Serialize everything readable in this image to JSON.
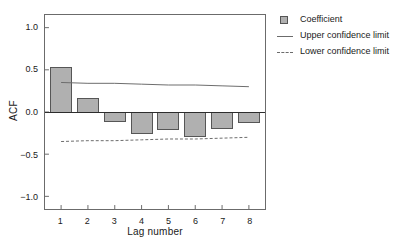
{
  "chart_data": {
    "type": "bar",
    "title": "",
    "subtitle": "",
    "xlabel": "Lag number",
    "ylabel": "ACF",
    "categories": [
      "1",
      "2",
      "3",
      "4",
      "5",
      "6",
      "7",
      "8"
    ],
    "x": [
      1,
      2,
      3,
      4,
      5,
      6,
      7,
      8
    ],
    "values": [
      0.53,
      0.16,
      -0.11,
      -0.25,
      -0.21,
      -0.29,
      -0.19,
      -0.13
    ],
    "series": [
      {
        "name": "Coefficient",
        "type": "bar",
        "values": [
          0.53,
          0.16,
          -0.11,
          -0.25,
          -0.21,
          -0.29,
          -0.19,
          -0.13
        ]
      },
      {
        "name": "Upper confidence limit",
        "type": "line",
        "style": "solid",
        "values": [
          0.35,
          0.34,
          0.34,
          0.33,
          0.32,
          0.32,
          0.31,
          0.3
        ]
      },
      {
        "name": "Lower confidence limit",
        "type": "line",
        "style": "dashed",
        "values": [
          -0.35,
          -0.34,
          -0.34,
          -0.33,
          -0.32,
          -0.32,
          -0.31,
          -0.3
        ]
      }
    ],
    "ylim": [
      -1.15,
      1.15
    ],
    "xlim": [
      0.4,
      8.6
    ],
    "yticks": [
      1.0,
      0.5,
      0.0,
      -0.5,
      -1.0
    ],
    "ytick_labels": [
      "1.0",
      "0.5",
      "0.0",
      "-0.5",
      "-1.0"
    ],
    "xticks": [
      1,
      2,
      3,
      4,
      5,
      6,
      7,
      8
    ],
    "xtick_labels": [
      "1",
      "2",
      "3",
      "4",
      "5",
      "6",
      "7",
      "8"
    ],
    "grid": false,
    "zero_line": true,
    "legend_position": "top-right",
    "colors": {
      "bar_fill": "#b0b0b0",
      "bar_edge": "#555555",
      "line": "#6b6b6b",
      "axis": "#6b6b6b",
      "text": "#1a1a1a",
      "background": "#ffffff"
    }
  },
  "legend": {
    "items": [
      {
        "label": "Coefficient",
        "key": "swatch-icon"
      },
      {
        "label": "Upper confidence limit",
        "key": "solid-line-icon"
      },
      {
        "label": "Lower confidence limit",
        "key": "dashed-line-icon"
      }
    ]
  },
  "axes": {
    "y_title": "ACF",
    "x_title": "Lag number"
  }
}
